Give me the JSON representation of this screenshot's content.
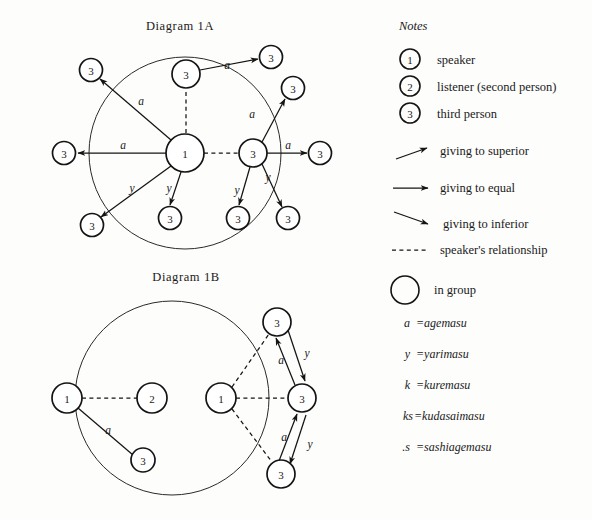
{
  "figure": {
    "diagram_a_title": "Diagram 1A",
    "diagram_b_title": "Diagram 1B"
  },
  "notes": {
    "heading": "Notes",
    "person_keys": [
      {
        "symbol": "1",
        "label": "speaker"
      },
      {
        "symbol": "2",
        "label": "listener (second person)"
      },
      {
        "symbol": "3",
        "label": "third person"
      }
    ],
    "line_keys": [
      {
        "icon": "arrow-up-right-icon",
        "label": "giving to superior"
      },
      {
        "icon": "arrow-right-icon",
        "label": "giving to equal"
      },
      {
        "icon": "arrow-down-right-icon",
        "label": "giving to inferior"
      },
      {
        "icon": "dashed-line-icon",
        "label": "speaker's relationship"
      }
    ],
    "group_key": {
      "icon": "circle-outline-icon",
      "label": "in group"
    },
    "abbreviations": [
      {
        "key": "a",
        "eq": "=",
        "value": "agemasu"
      },
      {
        "key": "y",
        "eq": "=",
        "value": "yarimasu"
      },
      {
        "key": "k",
        "eq": "=",
        "value": "kuremasu"
      },
      {
        "key": "ks",
        "eq": "=",
        "value": "kudasaimasu"
      },
      {
        "key": ".s",
        "eq": "=",
        "value": "sashiagemasu"
      }
    ]
  },
  "diagram_a": {
    "group_circle": {
      "cx": 185,
      "cy": 153,
      "r": 96
    },
    "nodes": [
      {
        "id": "a-speaker",
        "label": "1",
        "cx": 185,
        "cy": 153,
        "r": 19
      },
      {
        "id": "a-inner-top",
        "label": "3",
        "cx": 186,
        "cy": 74,
        "r": 14
      },
      {
        "id": "a-right-hub",
        "label": "3",
        "cx": 253,
        "cy": 153,
        "r": 14
      },
      {
        "id": "a-out-upleft",
        "label": "3",
        "cx": 91,
        "cy": 70,
        "r": 11.5
      },
      {
        "id": "a-out-left",
        "label": "3",
        "cx": 64,
        "cy": 153,
        "r": 11.5
      },
      {
        "id": "a-out-lowleft",
        "label": "3",
        "cx": 92,
        "cy": 225,
        "r": 11.5
      },
      {
        "id": "a-in-bottom",
        "label": "3",
        "cx": 170,
        "cy": 218,
        "r": 11.5
      },
      {
        "id": "a-in-bottom-right",
        "label": "3",
        "cx": 238,
        "cy": 218,
        "r": 11.5
      },
      {
        "id": "a-out-bottom-right",
        "label": "3",
        "cx": 288,
        "cy": 218,
        "r": 11.5
      },
      {
        "id": "a-out-topright",
        "label": "3",
        "cx": 271,
        "cy": 57,
        "r": 11.5
      },
      {
        "id": "a-out-right-upper",
        "label": "3",
        "cx": 293,
        "cy": 88,
        "r": 11.5
      },
      {
        "id": "a-out-right",
        "label": "3",
        "cx": 320,
        "cy": 153,
        "r": 11.5
      }
    ],
    "edges": [
      {
        "from": "a-speaker",
        "to": "a-out-upleft",
        "label": "a",
        "style": "solid",
        "arrow": true
      },
      {
        "from": "a-speaker",
        "to": "a-out-left",
        "label": "a",
        "style": "solid",
        "arrow": true
      },
      {
        "from": "a-speaker",
        "to": "a-out-lowleft",
        "label": "y",
        "style": "solid",
        "arrow": true
      },
      {
        "from": "a-speaker",
        "to": "a-in-bottom",
        "label": "y",
        "style": "solid",
        "arrow": true
      },
      {
        "from": "a-speaker",
        "to": "a-inner-top",
        "label": "",
        "style": "dashed",
        "arrow": false
      },
      {
        "from": "a-speaker",
        "to": "a-right-hub",
        "label": "",
        "style": "dashed",
        "arrow": false
      },
      {
        "from": "a-inner-top",
        "to": "a-out-topright",
        "label": "a",
        "style": "solid",
        "arrow": true
      },
      {
        "from": "a-right-hub",
        "to": "a-out-right-upper",
        "label": "a",
        "style": "solid",
        "arrow": true
      },
      {
        "from": "a-right-hub",
        "to": "a-out-right",
        "label": "a",
        "style": "solid",
        "arrow": true
      },
      {
        "from": "a-right-hub",
        "to": "a-in-bottom-right",
        "label": "y",
        "style": "solid",
        "arrow": true
      },
      {
        "from": "a-right-hub",
        "to": "a-out-bottom-right",
        "label": "y",
        "style": "solid",
        "arrow": true
      }
    ]
  },
  "diagram_b": {
    "group_circle": {
      "cx": 172,
      "cy": 398,
      "r": 97
    },
    "nodes": [
      {
        "id": "b-speaker-out",
        "label": "1",
        "cx": 67,
        "cy": 398,
        "r": 15
      },
      {
        "id": "b-listener",
        "label": "2",
        "cx": 152,
        "cy": 398,
        "r": 15
      },
      {
        "id": "b-third-lower",
        "label": "3",
        "cx": 143,
        "cy": 460,
        "r": 12
      },
      {
        "id": "b-speaker-in",
        "label": "1",
        "cx": 221,
        "cy": 398,
        "r": 15
      },
      {
        "id": "b-third-top",
        "label": "3",
        "cx": 277,
        "cy": 322,
        "r": 14
      },
      {
        "id": "b-third-mid",
        "label": "3",
        "cx": 302,
        "cy": 398,
        "r": 14
      },
      {
        "id": "b-third-bot",
        "label": "3",
        "cx": 281,
        "cy": 474,
        "r": 14
      }
    ],
    "edges": [
      {
        "from": "b-speaker-out",
        "to": "b-listener",
        "label": "",
        "style": "dashed",
        "arrow": false
      },
      {
        "from": "b-speaker-out",
        "to": "b-third-lower",
        "label": "a",
        "style": "solid",
        "arrow": false
      },
      {
        "from": "b-speaker-in",
        "to": "b-third-mid",
        "label": "",
        "style": "dashed",
        "arrow": false
      },
      {
        "from": "b-speaker-in",
        "to": "b-third-top",
        "label": "",
        "style": "dashed",
        "arrow": false
      },
      {
        "from": "b-speaker-in",
        "to": "b-third-bot",
        "label": "",
        "style": "dashed",
        "arrow": false
      },
      {
        "from": "b-third-mid",
        "to": "b-third-top",
        "label": "a",
        "style": "solid",
        "arrow": true
      },
      {
        "from": "b-third-top",
        "to": "b-third-mid",
        "label": "y",
        "style": "solid",
        "arrow": true
      },
      {
        "from": "b-third-bot",
        "to": "b-third-mid",
        "label": "a",
        "style": "solid",
        "arrow": true
      },
      {
        "from": "b-third-mid",
        "to": "b-third-bot",
        "label": "y",
        "style": "solid",
        "arrow": true
      }
    ]
  }
}
